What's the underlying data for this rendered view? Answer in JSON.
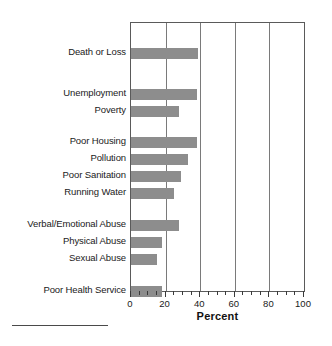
{
  "chart_data": {
    "type": "bar",
    "orientation": "horizontal",
    "title": "",
    "xlabel": "Percent",
    "ylabel": "",
    "xlim": [
      0,
      100
    ],
    "ylim": null,
    "grid": true,
    "legend": null,
    "bar_color": "#8d8d8d",
    "frame_color": "#5a5a5a",
    "categories": [
      "Death or Loss",
      "Unemployment",
      "Poverty",
      "Poor Housing",
      "Pollution",
      "Poor Sanitation",
      "Running Water",
      "Verbal/Emotional Abuse",
      "Physical Abuse",
      "Sexual Abuse",
      "Poor Health Service"
    ],
    "values": [
      39,
      38,
      28,
      38,
      33,
      29,
      25,
      28,
      18,
      15,
      18
    ],
    "xticks": [
      0,
      20,
      40,
      60,
      80,
      100
    ],
    "xtick_labels": [
      "0",
      "20",
      "40",
      "60",
      "80",
      "100"
    ],
    "minor_tick_step": 5,
    "groups": [
      {
        "name": "group-1",
        "categories": [
          "Death or Loss"
        ]
      },
      {
        "name": "group-2",
        "categories": [
          "Unemployment",
          "Poverty"
        ]
      },
      {
        "name": "group-3",
        "categories": [
          "Poor Housing",
          "Pollution",
          "Poor Sanitation",
          "Running Water"
        ]
      },
      {
        "name": "group-4",
        "categories": [
          "Verbal/Emotional Abuse",
          "Physical Abuse",
          "Sexual Abuse"
        ]
      },
      {
        "name": "group-5",
        "categories": [
          "Poor Health Service"
        ]
      }
    ],
    "row_centers_px": [
      30,
      71,
      88,
      119,
      136,
      153,
      170,
      202,
      219,
      236,
      268
    ]
  }
}
